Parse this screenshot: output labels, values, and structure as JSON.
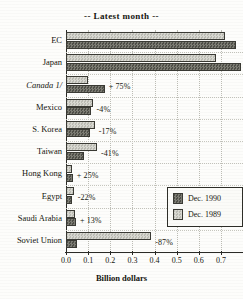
{
  "chart_data": {
    "type": "bar",
    "title": "-- Latest month --",
    "xlabel": "Billion dollars",
    "ylabel": "",
    "orientation": "horizontal",
    "xlim": [
      0.0,
      0.8
    ],
    "grid": true,
    "legend_position": "inside-lower-right",
    "tick_labels": [
      "0.0",
      "0.1",
      "0.2",
      "0.3",
      "0.4",
      "0.5",
      "0.6",
      "0.7"
    ],
    "tick_values": [
      0.0,
      0.1,
      0.2,
      0.3,
      0.4,
      0.5,
      0.6,
      0.7
    ],
    "categories": [
      "EC",
      "Japan",
      "Canada 1/",
      "Mexico",
      "S. Korea",
      "Taiwan",
      "Hong Kong",
      "Egypt",
      "Saudi Arabia",
      "Soviet Union"
    ],
    "series": [
      {
        "name": "Dec. 1989",
        "color": "#cdcdc6",
        "values": [
          0.72,
          0.68,
          0.1,
          0.12,
          0.13,
          0.14,
          0.025,
          0.035,
          0.04,
          0.385
        ]
      },
      {
        "name": "Dec. 1990",
        "color": "#6e6e66",
        "values": [
          0.77,
          0.79,
          0.175,
          0.115,
          0.108,
          0.082,
          0.031,
          0.027,
          0.045,
          0.05
        ]
      }
    ],
    "annotations": [
      {
        "category": "EC",
        "text": ""
      },
      {
        "category": "Japan",
        "text": "+ 5"
      },
      {
        "category": "Canada 1/",
        "text": "+ 75%"
      },
      {
        "category": "Mexico",
        "text": "-4%"
      },
      {
        "category": "S. Korea",
        "text": "-17%"
      },
      {
        "category": "Taiwan",
        "text": "-41%"
      },
      {
        "category": "Hong Kong",
        "text": "+ 25%"
      },
      {
        "category": "Egypt",
        "text": "-22%"
      },
      {
        "category": "Saudi Arabia",
        "text": "+ 13%"
      },
      {
        "category": "Soviet Union",
        "text": "-87%"
      }
    ],
    "legend_entries": [
      "Dec. 1990",
      "Dec. 1989"
    ]
  }
}
